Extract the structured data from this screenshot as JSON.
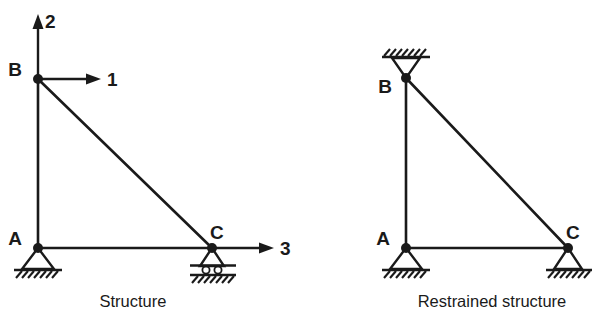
{
  "figure": {
    "stroke_color": "#1a1a1a",
    "background_color": "#ffffff"
  },
  "diagrams": [
    {
      "id": "structure",
      "caption": "Structure",
      "caption_x": 133,
      "caption_y": 305,
      "nodes": [
        {
          "name": "A",
          "label": "A",
          "x": 38,
          "y": 248,
          "label_x": 22,
          "label_y": 245,
          "support": "pinned"
        },
        {
          "name": "B",
          "label": "B",
          "x": 38,
          "y": 79,
          "label_x": 22,
          "label_y": 76,
          "support": "free"
        },
        {
          "name": "C",
          "label": "C",
          "x": 212,
          "y": 248,
          "label_x": 210,
          "label_y": 238,
          "support": "roller"
        }
      ],
      "members": [
        {
          "name": "member-AB",
          "from": "A",
          "to": "B"
        },
        {
          "name": "member-AC",
          "from": "A",
          "to": "C"
        },
        {
          "name": "member-BC",
          "from": "B",
          "to": "C"
        }
      ],
      "dof_arrows": [
        {
          "name": "dof-2-vertical-at-B",
          "label": "2",
          "at_node": "B",
          "direction": "up",
          "x1": 38,
          "y1": 74,
          "x2": 38,
          "y2": 20,
          "label_x": 45,
          "label_y": 26
        },
        {
          "name": "dof-1-horizontal-at-B",
          "label": "1",
          "at_node": "B",
          "direction": "right",
          "x1": 43,
          "y1": 79,
          "x2": 98,
          "y2": 79,
          "label_x": 105,
          "label_y": 86
        },
        {
          "name": "dof-3-horizontal-at-C",
          "label": "3",
          "at_node": "C",
          "direction": "right",
          "x1": 217,
          "y1": 248,
          "x2": 272,
          "y2": 248,
          "label_x": 279,
          "label_y": 255
        }
      ]
    },
    {
      "id": "restrained-structure",
      "caption": "Restrained structure",
      "caption_x": 492,
      "caption_y": 305,
      "nodes": [
        {
          "name": "A",
          "label": "A",
          "x": 406,
          "y": 248,
          "label_x": 390,
          "label_y": 245,
          "support": "pinned"
        },
        {
          "name": "B",
          "label": "B",
          "x": 406,
          "y": 78,
          "label_x": 390,
          "label_y": 92,
          "support": "pinned-ceiling"
        },
        {
          "name": "C",
          "label": "C",
          "x": 568,
          "y": 248,
          "label_x": 566,
          "label_y": 238,
          "support": "pinned"
        }
      ],
      "members": [
        {
          "name": "member-AB",
          "from": "A",
          "to": "B"
        },
        {
          "name": "member-AC",
          "from": "A",
          "to": "C"
        },
        {
          "name": "member-BC",
          "from": "B",
          "to": "C"
        }
      ],
      "dof_arrows": []
    }
  ],
  "legend": {
    "support_types": [
      {
        "key": "pinned",
        "description": "pinned support (triangle on hatched ground)"
      },
      {
        "key": "roller",
        "description": "roller support (triangle on rollers over hatched ground)"
      },
      {
        "key": "pinned-ceiling",
        "description": "inverted pinned support attached to hatched ceiling"
      }
    ]
  }
}
